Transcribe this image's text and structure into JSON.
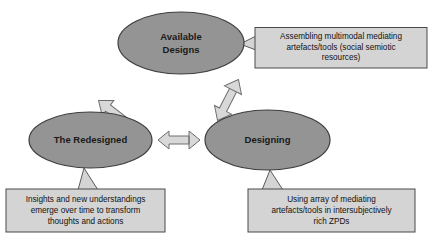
{
  "diagram": {
    "colors": {
      "ellipse_fill": "#949494",
      "ellipse_stroke": "#3d3d3d",
      "callout_fill": "#d4d4d4",
      "callout_stroke": "#4a4a4a",
      "arrow_fill": "#d8d8d8",
      "arrow_stroke": "#6e6e6e",
      "background": "#ffffff",
      "text": "#1a1a1a"
    },
    "nodes": [
      {
        "id": "available-designs",
        "label_lines": [
          "Available",
          "Designs"
        ],
        "shape": "ellipse"
      },
      {
        "id": "the-redesigned",
        "label_lines": [
          "The Redesigned"
        ],
        "shape": "ellipse"
      },
      {
        "id": "designing",
        "label_lines": [
          "Designing"
        ],
        "shape": "ellipse"
      }
    ],
    "callouts": [
      {
        "id": "available-designs-callout",
        "lines": [
          "Assembling multimodal mediating",
          "artefacts/tools (social semiotic",
          "resources)"
        ],
        "attached_to": "available-designs"
      },
      {
        "id": "the-redesigned-callout",
        "lines": [
          "Insights and new understandings",
          "emerge over time to transform",
          "thoughts and actions"
        ],
        "attached_to": "the-redesigned"
      },
      {
        "id": "designing-callout",
        "lines": [
          "Using array of mediating",
          "artefacts/tools in intersubjectively",
          "rich ZPDs"
        ],
        "attached_to": "designing"
      }
    ],
    "arrows": [
      {
        "id": "redesigned-to-available",
        "from": "the-redesigned",
        "to": "available-designs",
        "style": "single-headed",
        "direction": "up-right"
      },
      {
        "id": "available-designing",
        "from": "available-designs",
        "to": "designing",
        "style": "double-headed",
        "direction": "diagonal"
      },
      {
        "id": "redesigned-designing",
        "from": "the-redesigned",
        "to": "designing",
        "style": "double-headed",
        "direction": "horizontal"
      }
    ]
  }
}
